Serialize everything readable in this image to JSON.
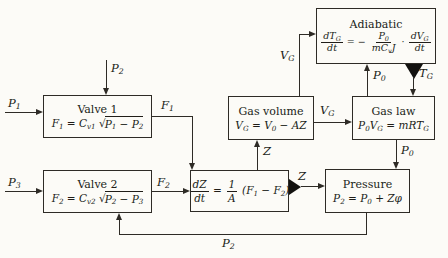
{
  "diagram": {
    "colors": {
      "ink": "#2e2b26",
      "background": "#fcfbf7",
      "text": "#201d18",
      "triangle": "#131210"
    },
    "boxes": {
      "valve1": {
        "title": "Valve 1",
        "formula": "F_1_ = C_v1_ √[P_1_ − P_2_]"
      },
      "valve2": {
        "title": "Valve 2",
        "formula": "F_2_ = C_v2_ √[P_2_ − P_3_]"
      },
      "integrator": {
        "formula": "{dZ¦dt} = {1¦A} (F_1_ − F_2_)"
      },
      "gas_volume": {
        "title": "Gas volume",
        "formula": "V_G_ = V_0_ − AZ"
      },
      "gas_law": {
        "title": "Gas law",
        "formula": "P_0_V_G_ = mRT_G_"
      },
      "adiabatic": {
        "title": "Adiabatic",
        "formula": "{dT_G_¦dt} = − {P_0_¦mC_v_J} · {dV_G_¦dt}"
      },
      "pressure": {
        "title": "Pressure",
        "formula": "P_2_ = P_0_ + Zφ"
      }
    },
    "signals": {
      "p1_in": "P_1_",
      "p2_top": "P_2_",
      "p3_in": "P_3_",
      "f1": "F_1_",
      "f2": "F_2_",
      "z_up": "Z",
      "z_out": "Z",
      "vg_right": "V_G_",
      "vg_up": "V_G_",
      "p0_up": "P_0_",
      "tg_down": "T_G_",
      "p0_down": "P_0_",
      "p2_feedback": "P_2_"
    }
  }
}
